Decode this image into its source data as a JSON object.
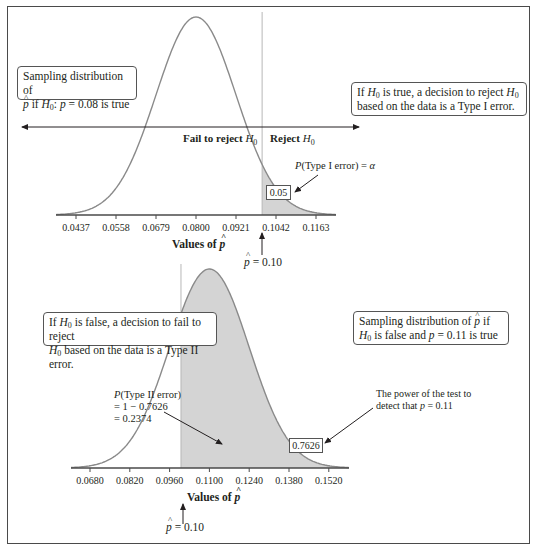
{
  "colors": {
    "curve": "#8a8a8a",
    "shade": "#d4d4d4",
    "axis": "#4a4a4a",
    "text": "#231f20"
  },
  "chart_data": [
    {
      "type": "area",
      "name": "null-distribution",
      "description": "Sampling distribution of p-hat if H0: p = 0.08 is true",
      "mean": 0.08,
      "sd": 0.0121,
      "x_ticks": [
        "0.0437",
        "0.0558",
        "0.0679",
        "0.0800",
        "0.0921",
        "0.1042",
        "0.1163"
      ],
      "xlim": [
        0.0387,
        0.1213
      ],
      "xlabel": "Values of p̂",
      "cutoff": 0.1,
      "cutoff_label": "p̂ = 0.10",
      "shaded_region": "right-of-cutoff",
      "shaded_area": 0.05,
      "region_labels": {
        "fail": "Fail to reject H0",
        "reject": "Reject H0"
      },
      "annotations": {
        "shaded_value": "0.05",
        "type1_label": "P(Type I error) = α",
        "left_box": "Sampling distribution of p̂ if H0: p = 0.08 is true",
        "right_box": "If H0 is true, a decision to reject H0 based on the data is a Type I error."
      }
    },
    {
      "type": "area",
      "name": "alternative-distribution",
      "description": "Sampling distribution of p-hat if H0 is false and p = 0.11 is true",
      "mean": 0.11,
      "sd": 0.014,
      "x_ticks": [
        "0.0680",
        "0.0820",
        "0.0960",
        "0.1100",
        "0.1240",
        "0.1380",
        "0.1520"
      ],
      "xlim": [
        0.0636,
        0.1564
      ],
      "xlabel": "Values of p̂",
      "cutoff": 0.1,
      "cutoff_label": "p̂ = 0.10",
      "shaded_region": "right-of-cutoff",
      "shaded_area": 0.7626,
      "annotations": {
        "shaded_value": "0.7626",
        "type2_lines": [
          "P(Type II error)",
          "= 1 − 0.7626",
          "= 0.2374"
        ],
        "power_lines": [
          "The power of the test to",
          "detect that p = 0.11"
        ],
        "left_box": "If H0 is false, a decision to fail to reject H0 based on the data is a Type II error.",
        "right_box": "Sampling distribution of p̂ if H0 is false and p = 0.11 is true"
      }
    }
  ],
  "text": {
    "top": {
      "left_box_l1": "Sampling distribution of",
      "left_box_l2a": "if ",
      "left_box_l2b": ": ",
      "left_box_l2c": " = 0.08 is true",
      "right_box_l1a": "If ",
      "right_box_l1b": " is true, a decision to reject ",
      "right_box_l2": "based on the data is a Type I error.",
      "fail": "Fail to reject ",
      "reject": "Reject ",
      "type1": "(Type I error) = ",
      "alpha": "α",
      "shaded_value": "0.05",
      "xlabel": "Values of ",
      "cutoff_eq": " = 0.10"
    },
    "bottom": {
      "left_box_l1a": "If ",
      "left_box_l1b": " is false, a decision to fail to reject",
      "left_box_l2": " based on the data is a Type II error.",
      "right_box_l1": "Sampling distribution of ",
      "right_box_l1b": " if",
      "right_box_l2a": " is false and ",
      "right_box_l2b": " = 0.11 is true",
      "type2_l1": "(Type II error)",
      "type2_l2": "= 1 − 0.7626",
      "type2_l3": "= 0.2374",
      "power_l1": "The power of the test to",
      "power_l2a": "detect that ",
      "power_l2b": " = 0.11",
      "shaded_value": "0.7626",
      "xlabel": "Values of ",
      "cutoff_eq": " = 0.10"
    },
    "sym": {
      "H": "H",
      "zero": "0",
      "p": "p",
      "P": "P",
      "phat": "p"
    }
  }
}
